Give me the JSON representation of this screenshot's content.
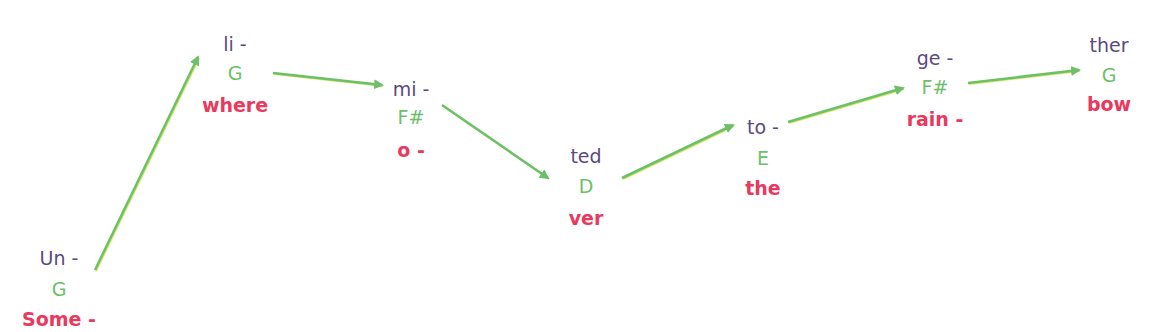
{
  "colors": {
    "syllable": "#5b4a7e",
    "note": "#6cc06a",
    "word": "#e8395e",
    "arrow": "#6cc06a",
    "arrow_edge": "#d8e860"
  },
  "nodes": [
    {
      "syllable": "Un -",
      "note": "G",
      "word": "Some -",
      "x": 59,
      "ys": [
        258,
        289,
        319
      ]
    },
    {
      "syllable": "li -",
      "note": "G",
      "word": "where",
      "x": 235,
      "ys": [
        44,
        73,
        105
      ]
    },
    {
      "syllable": "mi -",
      "note": "F#",
      "word": "o -",
      "x": 411,
      "ys": [
        89,
        117,
        150
      ]
    },
    {
      "syllable": "ted",
      "note": "D",
      "word": "ver",
      "x": 586,
      "ys": [
        156,
        186,
        218
      ]
    },
    {
      "syllable": "to -",
      "note": "E",
      "word": "the",
      "x": 763,
      "ys": [
        127,
        158,
        188
      ]
    },
    {
      "syllable": "ge -",
      "note": "F#",
      "word": "rain -",
      "x": 935,
      "ys": [
        58,
        87,
        119
      ]
    },
    {
      "syllable": "ther",
      "note": "G",
      "word": "bow",
      "x": 1109,
      "ys": [
        45,
        75,
        104
      ]
    }
  ],
  "arrows": [
    {
      "from": 0,
      "to": 1,
      "x1": 95,
      "y1": 270,
      "x2": 198,
      "y2": 57
    },
    {
      "from": 1,
      "to": 2,
      "x1": 273,
      "y1": 73,
      "x2": 382,
      "y2": 85
    },
    {
      "from": 2,
      "to": 3,
      "x1": 442,
      "y1": 105,
      "x2": 548,
      "y2": 178
    },
    {
      "from": 3,
      "to": 4,
      "x1": 622,
      "y1": 178,
      "x2": 733,
      "y2": 125
    },
    {
      "from": 4,
      "to": 5,
      "x1": 788,
      "y1": 122,
      "x2": 903,
      "y2": 88
    },
    {
      "from": 5,
      "to": 6,
      "x1": 968,
      "y1": 83,
      "x2": 1079,
      "y2": 70
    }
  ]
}
